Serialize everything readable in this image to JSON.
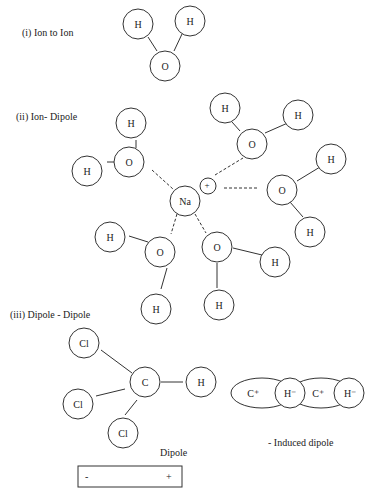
{
  "sections": {
    "ion_ion": {
      "title": "(i) Ion to Ion",
      "atoms": [
        "H",
        "H",
        "O"
      ]
    },
    "ion_dipole": {
      "title": "(ii) Ion- Dipole",
      "center": "Na",
      "charge": "+",
      "water_atoms": {
        "o": "O",
        "h": "H"
      }
    },
    "dipole_dipole": {
      "title": "(iii) Dipole - Dipole",
      "molecule": {
        "c": "C",
        "h": "H",
        "cl": "Cl"
      },
      "dipole_label": "Dipole",
      "dipole_box": {
        "neg": "-",
        "pos": "+"
      },
      "induced": {
        "c": "C⁺",
        "h": "H⁻"
      },
      "induced_label": "- Induced dipole"
    }
  }
}
